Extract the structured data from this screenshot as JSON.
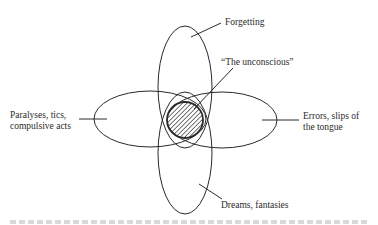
{
  "diagram": {
    "type": "overlapping-ellipses",
    "labels": {
      "top": "Forgetting",
      "center": "“The unconscious”",
      "left_line1": "Paralyses, tics,",
      "left_line2": "compulsive acts",
      "right_line1": "Errors, slips of",
      "right_line2": "the tongue",
      "bottom": "Dreams, fantasies"
    },
    "colors": {
      "stroke": "#2a2a2a",
      "background": "#ffffff"
    }
  }
}
